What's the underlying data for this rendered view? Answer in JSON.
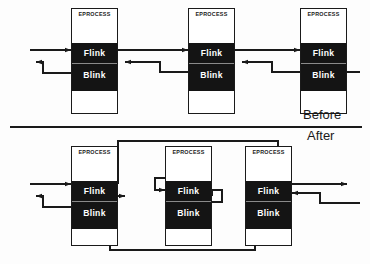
{
  "diagram": {
    "labels": {
      "before": "Before",
      "after": "After"
    },
    "field_names": {
      "header": "EPROCESS",
      "flink": "Flink",
      "blink": "Blink"
    },
    "colors": {
      "field_fill": "#141414",
      "field_text": "#ffffff",
      "block_border": "#1a1a1a",
      "block_fill": "#ffffff",
      "wire": "#1a1a1a",
      "background": "#fdfdfd"
    },
    "rows": [
      {
        "id": "before",
        "label": "Before",
        "description": "Three EPROCESS blocks linked in sequence via Flink and Blink pointers",
        "blocks": [
          {
            "id": "before-block-1",
            "header": "EPROCESS",
            "flink": "Flink",
            "blink": "Blink",
            "linked": true
          },
          {
            "id": "before-block-2",
            "header": "EPROCESS",
            "flink": "Flink",
            "blink": "Blink",
            "linked": true
          },
          {
            "id": "before-block-3",
            "header": "EPROCESS",
            "flink": "Flink",
            "blink": "Blink",
            "linked": true
          }
        ]
      },
      {
        "id": "after",
        "label": "After",
        "description": "Middle EPROCESS block unlinked; its Flink and Blink point to itself while neighbours bypass it",
        "blocks": [
          {
            "id": "after-block-1",
            "header": "EPROCESS",
            "flink": "Flink",
            "blink": "Blink",
            "linked": true
          },
          {
            "id": "after-block-2",
            "header": "EPROCESS",
            "flink": "Flink",
            "blink": "Blink",
            "linked": false
          },
          {
            "id": "after-block-3",
            "header": "EPROCESS",
            "flink": "Flink",
            "blink": "Blink",
            "linked": true
          }
        ]
      }
    ]
  }
}
